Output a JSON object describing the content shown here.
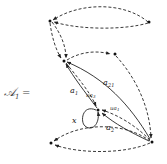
{
  "title": {
    "symbol": "𝒜",
    "subscript": "1",
    "equals": "="
  },
  "colors": {
    "stroke": "#222222",
    "text": "#333333",
    "background": "#ffffff"
  },
  "nodes": [
    {
      "id": "top-left",
      "x": 50,
      "y": 21
    },
    {
      "id": "top-right",
      "x": 149,
      "y": 22
    },
    {
      "id": "mid-left",
      "x": 64,
      "y": 61
    },
    {
      "id": "mid-right",
      "x": 115,
      "y": 54
    },
    {
      "id": "center",
      "x": 98,
      "y": 110
    },
    {
      "id": "bottom-right",
      "x": 152,
      "y": 142
    },
    {
      "id": "bottom-left",
      "x": 51,
      "y": 143
    }
  ],
  "labels": {
    "a21": "a",
    "a21_sub": "21",
    "a1": "a",
    "a1_sub": "1",
    "a2": "a",
    "a2_sub": "2",
    "ua3": "ua",
    "ua3_sub": "3",
    "ua1": "ua",
    "ua1_sub": "1",
    "x": "x"
  }
}
